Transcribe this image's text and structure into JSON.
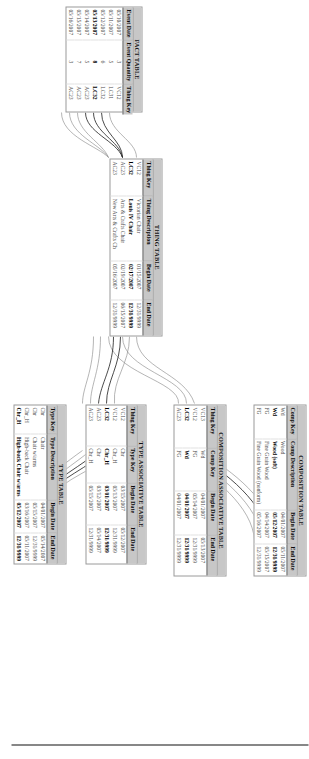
{
  "diagram": {
    "orientation_degrees": 90,
    "accent_header": "#c7c7c7",
    "link_color": "#8d8d8d",
    "link_color_highlight": "#1d1d1d"
  },
  "fact_table": {
    "caption": "FACT TABLE",
    "columns": [
      "Event Date",
      "Event Quantity",
      "Thing Key"
    ],
    "rows": [
      {
        "event_date": "05/10/2007",
        "event_quantity": "3",
        "thing_key": "VC12",
        "highlight": false
      },
      {
        "event_date": "05/11/2007",
        "event_quantity": "5",
        "thing_key": "LC31",
        "highlight": false
      },
      {
        "event_date": "05/12/2007",
        "event_quantity": "6",
        "thing_key": "LC32",
        "highlight": false
      },
      {
        "event_date": "05/13/2007",
        "event_quantity": "8",
        "thing_key": "LC32",
        "highlight": true
      },
      {
        "event_date": "05/14/2007",
        "event_quantity": "5",
        "thing_key": "AC23",
        "highlight": false
      },
      {
        "event_date": "05/15/2007",
        "event_quantity": "7",
        "thing_key": "AC23",
        "highlight": false
      },
      {
        "event_date": "05/16/2007",
        "event_quantity": "3",
        "thing_key": "AC23",
        "highlight": false
      }
    ]
  },
  "thing_table": {
    "caption": "THING TABLE",
    "columns": [
      "Thing Key",
      "Thing Description",
      "Begin Date",
      "End Date"
    ],
    "rows": [
      {
        "thing_key": "VC12",
        "thing_description": "Victorian Chair",
        "begin_date": "01/15/2007",
        "end_date": "12/31/9999",
        "highlight": false
      },
      {
        "thing_key": "LC32",
        "thing_description": "Louis IV Chair",
        "begin_date": "02/17/2007",
        "end_date": "12/31/9999",
        "highlight": true
      },
      {
        "thing_key": "AC23",
        "thing_description": "Arts & Crafts Chair",
        "begin_date": "02/19/2007",
        "end_date": "06/15/2007",
        "highlight": false
      },
      {
        "thing_key": "AC23",
        "thing_description": "New Arts & Crafts Ch",
        "begin_date": "05/16/2007",
        "end_date": "12/31/9999",
        "highlight": false
      }
    ]
  },
  "composition_table": {
    "caption": "COMPOSITION TABLE",
    "columns": [
      "Comp Key",
      "Comp Description",
      "Begin Date",
      "End Date"
    ],
    "rows": [
      {
        "comp_key": "Wd",
        "comp_description": "Wood",
        "begin_date": "04/01/2007",
        "end_date": "05/11/2007",
        "highlight": false
      },
      {
        "comp_key": "Wd",
        "comp_description": "Wood (soft)",
        "begin_date": "05/12/2007",
        "end_date": "12/31/9999",
        "highlight": true
      },
      {
        "comp_key": "FG",
        "comp_description": "Fine Grain Wood",
        "begin_date": "04/14/2007",
        "end_date": "05/15/2007",
        "highlight": false
      },
      {
        "comp_key": "FG",
        "comp_description": "Fine Grain Wood (nonform)",
        "begin_date": "05/16/2007",
        "end_date": "12/31/9999",
        "highlight": false
      }
    ]
  },
  "composition_associative_table": {
    "caption": "COMPOSITION ASSOCIATIVE TABLE",
    "columns": [
      "Thing Key",
      "Comp Key",
      "Begin Date",
      "End Date"
    ],
    "rows": [
      {
        "thing_key": "VC13",
        "comp_key": "Wd",
        "begin_date": "04/01/2007",
        "end_date": "05/13/2007",
        "highlight": false
      },
      {
        "thing_key": "VC12",
        "comp_key": "FG",
        "begin_date": "05/14/2007",
        "end_date": "12/31/9999",
        "highlight": false
      },
      {
        "thing_key": "LC32",
        "comp_key": "Wd",
        "begin_date": "04/01/2007",
        "end_date": "12/31/9999",
        "highlight": true
      },
      {
        "thing_key": "AC23",
        "comp_key": "FG",
        "begin_date": "04/01/2007",
        "end_date": "12/31/9999",
        "highlight": false
      }
    ]
  },
  "type_associative_table": {
    "caption": "TYPE ASSOCIATIVE TABLE",
    "columns": [
      "Thing Key",
      "Type Key",
      "Begin Date",
      "End Date"
    ],
    "rows": [
      {
        "thing_key": "VC12",
        "type_key": "Chr",
        "begin_date": "03/15/2007",
        "end_date": "05/12/2007",
        "highlight": false
      },
      {
        "thing_key": "VC12",
        "type_key": "Chr_H",
        "begin_date": "05/13/2007",
        "end_date": "12/31/9999",
        "highlight": false
      },
      {
        "thing_key": "LC32",
        "type_key": "Chr_H",
        "begin_date": "03/01/2007",
        "end_date": "12/31/9999",
        "highlight": true
      },
      {
        "thing_key": "AC23",
        "type_key": "Chr",
        "begin_date": "03/12/2007",
        "end_date": "05/14/2007",
        "highlight": false
      },
      {
        "thing_key": "AC23",
        "type_key": "Chr_H",
        "begin_date": "05/15/2007",
        "end_date": "12/31/9999",
        "highlight": false
      }
    ]
  },
  "type_table": {
    "caption": "TYPE TABLE",
    "columns": [
      "Type Key",
      "Type Description",
      "Begin Date",
      "End Date"
    ],
    "rows": [
      {
        "type_key": "Chr",
        "type_description": "Chair",
        "begin_date": "04/01/2007",
        "end_date": "05/14/2007",
        "highlight": false
      },
      {
        "type_key": "Chr",
        "type_description": "Chair w/arms",
        "begin_date": "05/15/2007",
        "end_date": "12/31/9999",
        "highlight": false
      },
      {
        "type_key": "Chr_H",
        "type_description": "High-back Chair",
        "begin_date": "03/16/2007",
        "end_date": "05/11/2007",
        "highlight": false
      },
      {
        "type_key": "Chr_H",
        "type_description": "High-back Chair w/arms",
        "begin_date": "05/12/2007",
        "end_date": "12/31/9999",
        "highlight": true
      }
    ]
  }
}
